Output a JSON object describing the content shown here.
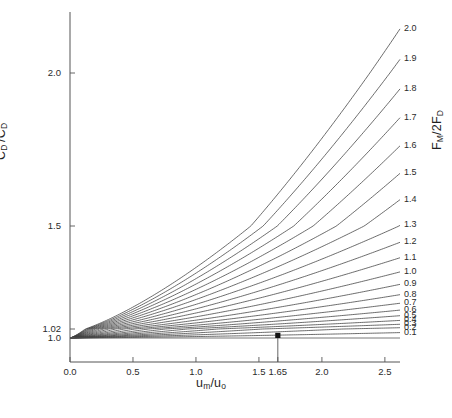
{
  "chart_data": {
    "type": "line",
    "title": "",
    "subtitle": "",
    "xlabel": "u_m/u_o",
    "xlabel_parts": {
      "base1": "u",
      "sub1": "m",
      "slash": "/",
      "base2": "u",
      "sub2": "o"
    },
    "ylabel": "C_D'/C_D",
    "ylabel_parts": {
      "base1": "C",
      "sub1": "D",
      "prime": "′",
      "slash": "/",
      "base2": "C",
      "sub2": "D"
    },
    "ylabel_right": "F_M/2F_D",
    "ylabel_right_parts": {
      "base1": "F",
      "sub1": "M",
      "mid": "/2",
      "base2": "F",
      "sub2": "D"
    },
    "grid": false,
    "legend_position": "right-inline-curve-labels",
    "xlim": [
      0.0,
      2.62
    ],
    "ylim": [
      1.0,
      2.28
    ],
    "xticks": [
      0.0,
      0.5,
      1.0,
      1.5,
      1.65,
      2.0,
      2.5
    ],
    "xticklabels": [
      "0.0",
      "0.5",
      "1.0",
      "1.5",
      "1.65",
      "2.0",
      "2.5"
    ],
    "yticks": [
      1.0,
      1.02,
      1.5,
      2.0
    ],
    "yticklabels": [
      "1.0",
      "1.02",
      "1.5",
      "2.0"
    ],
    "y_axis_note": "nonlinear (compressed near 1.0)",
    "series_parameter_name": "F_M/2F_D",
    "annotation_marker": {
      "x": 1.65,
      "label": "1.65",
      "shape": "filled-square",
      "dropline": true
    },
    "series": [
      {
        "name": "0.1",
        "label": "0.1",
        "y_at_xmax": 1.012
      },
      {
        "name": "0.2",
        "label": "0.2",
        "y_at_xmax": 1.026
      },
      {
        "name": "0.3",
        "label": "0.3",
        "y_at_xmax": 1.042
      },
      {
        "name": "0.4",
        "label": "0.4",
        "y_at_xmax": 1.06
      },
      {
        "name": "0.5",
        "label": "0.5",
        "y_at_xmax": 1.082
      },
      {
        "name": "0.6",
        "label": "0.6",
        "y_at_xmax": 1.108
      },
      {
        "name": "0.7",
        "label": "0.7",
        "y_at_xmax": 1.14
      },
      {
        "name": "0.8",
        "label": "0.8",
        "y_at_xmax": 1.18
      },
      {
        "name": "0.9",
        "label": "0.9",
        "y_at_xmax": 1.228
      },
      {
        "name": "1.0",
        "label": "1.0",
        "y_at_xmax": 1.286
      },
      {
        "name": "1.1",
        "label": "1.1",
        "y_at_xmax": 1.352
      },
      {
        "name": "1.2",
        "label": "1.2",
        "y_at_xmax": 1.424
      },
      {
        "name": "1.3",
        "label": "1.3",
        "y_at_xmax": 1.502
      },
      {
        "name": "1.4",
        "label": "1.4",
        "y_at_xmax": 1.586
      },
      {
        "name": "1.5",
        "label": "1.5",
        "y_at_xmax": 1.672
      },
      {
        "name": "1.6",
        "label": "1.6",
        "y_at_xmax": 1.762
      },
      {
        "name": "1.7",
        "label": "1.7",
        "y_at_xmax": 1.854
      },
      {
        "name": "1.8",
        "label": "1.8",
        "y_at_xmax": 1.948
      },
      {
        "name": "1.9",
        "label": "1.9",
        "y_at_xmax": 2.044
      },
      {
        "name": "2.0",
        "label": "2.0",
        "y_at_xmax": 2.142
      }
    ],
    "colors": {
      "line": "#3c3c3c",
      "axis": "#555555",
      "text": "#2a2a2a",
      "background": "#ffffff"
    }
  }
}
